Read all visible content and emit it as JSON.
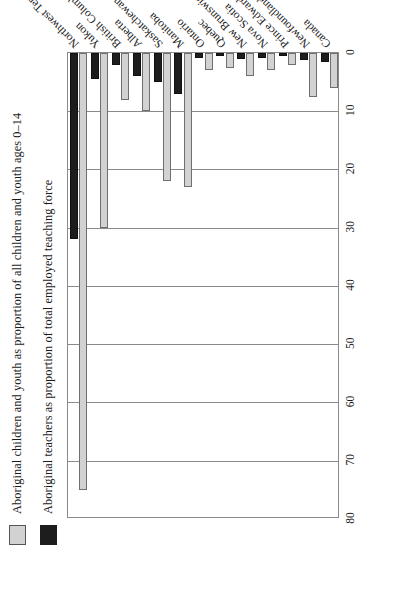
{
  "legend": {
    "items": [
      {
        "swatch": "light-gray-swatch",
        "label": "Aboriginal children and youth as proportion of all children and youth ages 0–14"
      },
      {
        "swatch": "black-swatch",
        "label": "Aboriginal teachers as proportion of total employed teaching force"
      }
    ]
  },
  "chart_data": {
    "type": "bar",
    "title": "",
    "subtitle": "",
    "xlabel": "",
    "ylabel": "",
    "orientation": "horizontal",
    "xlim": [
      0,
      80
    ],
    "ticks": [
      "0",
      "10",
      "20",
      "30",
      "40",
      "50",
      "60",
      "70",
      "80"
    ],
    "tick_values": [
      0,
      10,
      20,
      30,
      40,
      50,
      60,
      70,
      80
    ],
    "grid": true,
    "legend_position": "top-left",
    "categories": [
      "Canada",
      "Newfoundland",
      "Prince Edward Island",
      "Nova Scotia",
      "New Brunswick",
      "Quebec",
      "Ontario",
      "Manitoba",
      "Saskatchewan",
      "Alberta",
      "British Columbia",
      "Yukon",
      "Northwest Territories"
    ],
    "series": [
      {
        "name": "Aboriginal children and youth as proportion of all children and youth ages 0–14",
        "color": "#d2d2d2",
        "values": [
          6.0,
          7.5,
          2.0,
          3.0,
          4.0,
          2.5,
          3.0,
          23.0,
          22.0,
          10.0,
          8.0,
          30.0,
          75.0
        ]
      },
      {
        "name": "Aboriginal teachers as proportion of total employed teaching force",
        "color": "#1d1d1d",
        "values": [
          1.5,
          1.2,
          0.5,
          0.8,
          1.0,
          0.6,
          0.8,
          7.0,
          5.0,
          4.0,
          2.0,
          4.5,
          32.0
        ]
      }
    ]
  }
}
